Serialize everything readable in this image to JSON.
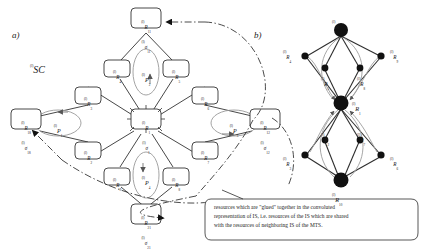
{
  "figure": {
    "panel_a": {
      "letter": "a)",
      "system_label": "SC",
      "system_label_sup": "(l)",
      "nodes": [
        {
          "id": "n-top",
          "lines": [
            {
              "sup": "(l)",
              "base": "R",
              "sub": "11"
            },
            {
              "sup": "(l)",
              "base": "σ",
              "sub": "11"
            }
          ],
          "x": 146,
          "y": 22
        },
        {
          "id": "n-r4",
          "lines": [
            {
              "sup": "(l)",
              "base": "R",
              "sub": "4"
            }
          ],
          "x": 117,
          "y": 69
        },
        {
          "id": "n-r5",
          "lines": [
            {
              "sup": "(l)",
              "base": "R",
              "sub": "5"
            }
          ],
          "x": 176,
          "y": 69
        },
        {
          "id": "n-r3",
          "lines": [
            {
              "sup": "(l)",
              "base": "R",
              "sub": "3"
            }
          ],
          "x": 88,
          "y": 96
        },
        {
          "id": "n-r6",
          "lines": [
            {
              "sup": "(l)",
              "base": "R",
              "sub": "6"
            }
          ],
          "x": 205,
          "y": 96
        },
        {
          "id": "n-left",
          "lines": [
            {
              "sup": "(l)",
              "base": "R",
              "sub": "18"
            },
            {
              "sup": "(l)",
              "base": "σ",
              "sub": "18"
            }
          ],
          "x": 26,
          "y": 123
        },
        {
          "id": "n-center",
          "lines": [
            {
              "sup": "(l)",
              "base": "R",
              "sub": "1"
            },
            {
              "sup": "(l)",
              "base": "σ",
              "sub": "1"
            }
          ],
          "x": 146,
          "y": 123
        },
        {
          "id": "n-right",
          "lines": [
            {
              "sup": "(l)",
              "base": "R",
              "sub": "12"
            },
            {
              "sup": "(l)",
              "base": "σ",
              "sub": "12"
            }
          ],
          "x": 265,
          "y": 123
        },
        {
          "id": "n-r2",
          "lines": [
            {
              "sup": "(l)",
              "base": "R",
              "sub": "2"
            }
          ],
          "x": 88,
          "y": 150
        },
        {
          "id": "n-r7",
          "lines": [
            {
              "sup": "(l)",
              "base": "R",
              "sub": "7"
            }
          ],
          "x": 205,
          "y": 150
        },
        {
          "id": "n-r9",
          "lines": [
            {
              "sup": "(l)",
              "base": "R",
              "sub": "9"
            }
          ],
          "x": 117,
          "y": 177
        },
        {
          "id": "n-r8",
          "lines": [
            {
              "sup": "(l)",
              "base": "R",
              "sub": "8"
            }
          ],
          "x": 176,
          "y": 177
        },
        {
          "id": "n-bottom",
          "lines": [
            {
              "sup": "(l)",
              "base": "R",
              "sub": "21"
            },
            {
              "sup": "(l)",
              "base": "σ",
              "sub": "21"
            }
          ],
          "x": 146,
          "y": 218
        }
      ],
      "processes": [
        {
          "id": "p2",
          "sup": "(l)",
          "base": "P",
          "sub": "2",
          "x": 146,
          "y": 72
        },
        {
          "id": "p1",
          "sup": "(l)",
          "base": "P",
          "sub": "1",
          "x": 58,
          "y": 123
        },
        {
          "id": "p3",
          "sup": "(l)",
          "base": "P",
          "sub": "3",
          "x": 234,
          "y": 123
        },
        {
          "id": "p4",
          "sup": "(l)",
          "base": "P",
          "sub": "4",
          "x": 146,
          "y": 175
        }
      ]
    },
    "panel_b": {
      "letter": "b)",
      "nodes": [
        {
          "id": "b-r11",
          "sup": "(l)",
          "base": "R",
          "sub": "11",
          "x": 341,
          "y": 30,
          "big": true
        },
        {
          "id": "b-r4",
          "sup": "(l)",
          "base": "R",
          "sub": "4",
          "x": 305,
          "y": 55,
          "big": false
        },
        {
          "id": "b-r9",
          "sup": "(l)",
          "base": "R",
          "sub": "9",
          "x": 382,
          "y": 55,
          "big": false
        },
        {
          "id": "b-r5",
          "sup": "(l)",
          "base": "R",
          "sub": "5",
          "x": 324,
          "y": 68,
          "big": false
        },
        {
          "id": "b-r8",
          "sup": "(l)",
          "base": "R",
          "sub": "8",
          "x": 360,
          "y": 68,
          "big": false
        },
        {
          "id": "b-r1",
          "sup": "(l)",
          "base": "R",
          "sub": "1",
          "x": 341,
          "y": 103,
          "big": true
        },
        {
          "id": "b-r2",
          "sup": "(l)",
          "base": "R",
          "sub": "2",
          "x": 324,
          "y": 140,
          "big": false
        },
        {
          "id": "b-r7",
          "sup": "(l)",
          "base": "R",
          "sub": "7",
          "x": 360,
          "y": 140,
          "big": false
        },
        {
          "id": "b-r3",
          "sup": "(l)",
          "base": "R",
          "sub": "3",
          "x": 305,
          "y": 155,
          "big": false
        },
        {
          "id": "b-r6",
          "sup": "(l)",
          "base": "R",
          "sub": "6",
          "x": 382,
          "y": 155,
          "big": false
        },
        {
          "id": "b-r10",
          "sup": "(l)",
          "base": "R",
          "sub": "10",
          "x": 341,
          "y": 180,
          "big": true
        }
      ]
    },
    "caption": {
      "lines": [
        "resources which   are  \"glued\" together in the convoluted",
        "representation of IS, i.e. resources of the IS which are shared",
        "with the resources of neighboring IS of the MTS."
      ]
    },
    "colors": {
      "stroke": "#2b2b2b",
      "light_stroke": "#9a9a9a",
      "node_fill": "#ffffff",
      "dot_fill": "#111111",
      "text": "#1a1a1a",
      "background": "#ffffff"
    }
  }
}
